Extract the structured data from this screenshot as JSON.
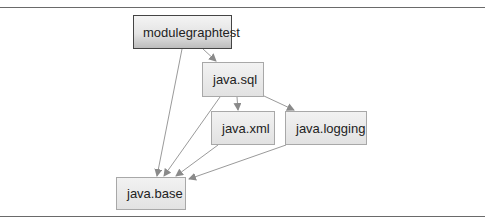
{
  "diagram": {
    "type": "module-dependency-graph",
    "nodes": [
      {
        "id": "modulegraphtest",
        "label": "modulegraphtest"
      },
      {
        "id": "java.sql",
        "label": "java.sql"
      },
      {
        "id": "java.xml",
        "label": "java.xml"
      },
      {
        "id": "java.logging",
        "label": "java.logging"
      },
      {
        "id": "java.base",
        "label": "java.base"
      }
    ],
    "edges": [
      {
        "from": "modulegraphtest",
        "to": "java.sql"
      },
      {
        "from": "modulegraphtest",
        "to": "java.base"
      },
      {
        "from": "java.sql",
        "to": "java.xml"
      },
      {
        "from": "java.sql",
        "to": "java.logging"
      },
      {
        "from": "java.sql",
        "to": "java.base"
      },
      {
        "from": "java.xml",
        "to": "java.base"
      },
      {
        "from": "java.logging",
        "to": "java.base"
      }
    ],
    "colors": {
      "edge": "#8a8a8a",
      "node_border": "#a8a8a8",
      "root_border": "#444444",
      "rule": "#6a6a6a"
    }
  }
}
